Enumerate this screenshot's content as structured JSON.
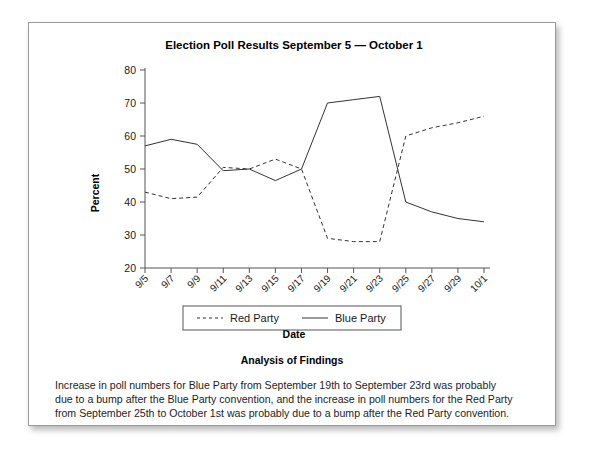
{
  "card": {
    "analysis_heading": "Analysis of Findings",
    "analysis_line1": "Increase in poll numbers for Blue Party from September 19th to September 23rd was probably",
    "analysis_line2": "due to a bump after the Blue Party convention, and the increase in poll numbers for the Red Party",
    "analysis_line3": "from September 25th to October 1st was probably due to a bump after the Red Party convention."
  },
  "chart_data": {
    "type": "line",
    "title": "Election Poll Results September 5 — October 1",
    "xlabel": "Date",
    "ylabel": "Percent",
    "ylim": [
      20,
      80
    ],
    "yticks": [
      20,
      30,
      40,
      50,
      60,
      70,
      80
    ],
    "grid": false,
    "legend_position": "bottom-center",
    "x_tick_rotation": -45,
    "categories": [
      "9/5",
      "9/7",
      "9/9",
      "9/11",
      "9/13",
      "9/15",
      "9/17",
      "9/19",
      "9/21",
      "9/23",
      "9/25",
      "9/27",
      "9/29",
      "10/1"
    ],
    "series": [
      {
        "name": "Red Party",
        "style": "dashed",
        "color": "#333333",
        "values": [
          43,
          41,
          41.5,
          50.5,
          50,
          53,
          50,
          29,
          28,
          28,
          60,
          62.5,
          64,
          66
        ]
      },
      {
        "name": "Blue Party",
        "style": "solid",
        "color": "#333333",
        "values": [
          57,
          59,
          57.5,
          49.5,
          50,
          46.5,
          50,
          70,
          71,
          72,
          40,
          37,
          35,
          34
        ]
      }
    ]
  }
}
